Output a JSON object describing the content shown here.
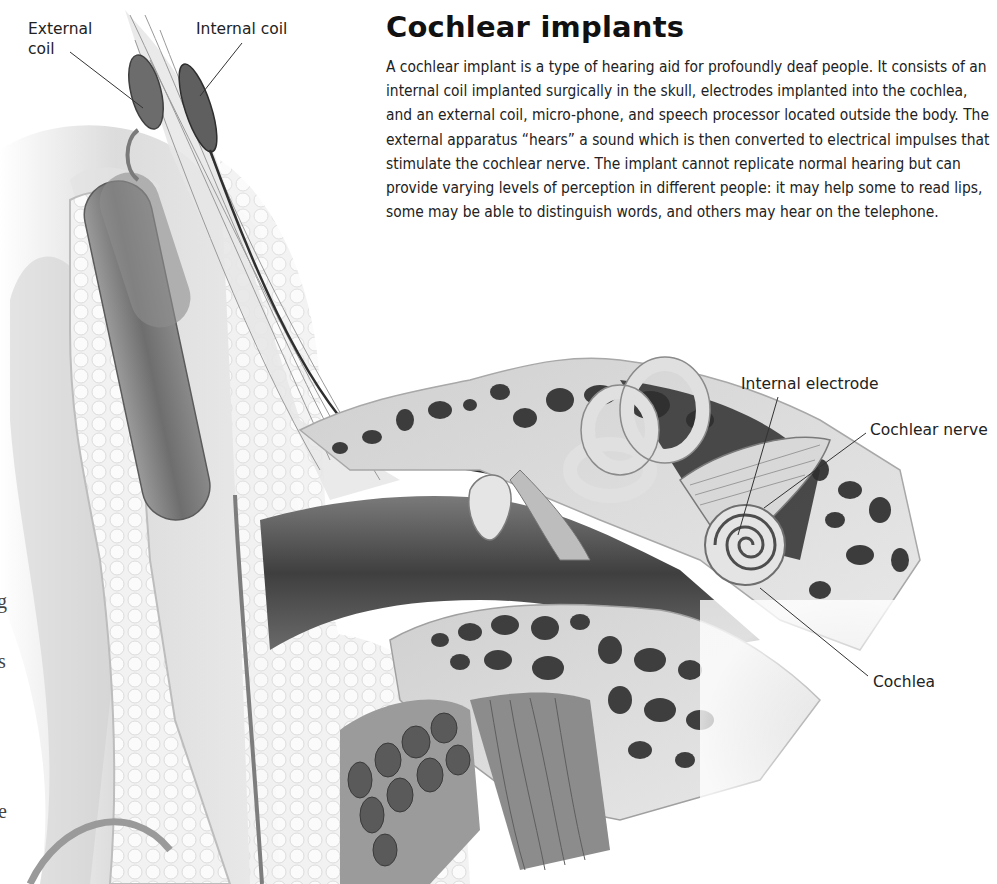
{
  "page": {
    "title": "Cochlear implants",
    "body": "A cochlear implant is a type of hearing aid for profoundly deaf people. It consists of an internal coil implanted surgically in the skull, electrodes implanted into the cochlea, and an external coil, micro-phone, and speech processor located outside the body. The external apparatus “hears” a sound which is then converted to electrical impulses that stimulate the cochlear nerve. The implant cannot replicate normal hearing but can provide varying levels of perception in different people: it may help some to read lips, some may be able to distinguish words, and others may hear on the telephone."
  },
  "illustration": {
    "subject": "cross-section of ear with cochlear implant",
    "labels": {
      "external_coil": "External coil",
      "internal_coil": "Internal coil",
      "internal_electrode": "Internal electrode",
      "cochlear_nerve": "Cochlear nerve",
      "cochlea": "Cochlea"
    },
    "colors": {
      "bone": "#d9d9d9",
      "bone_pores": "#3a3a3a",
      "canal_dark": "#4a4a4a",
      "tissue_light": "#eeeeee",
      "leader_line": "#333333"
    }
  },
  "edge_fragments": {
    "g": "g",
    "s": "s",
    "e": "e"
  }
}
